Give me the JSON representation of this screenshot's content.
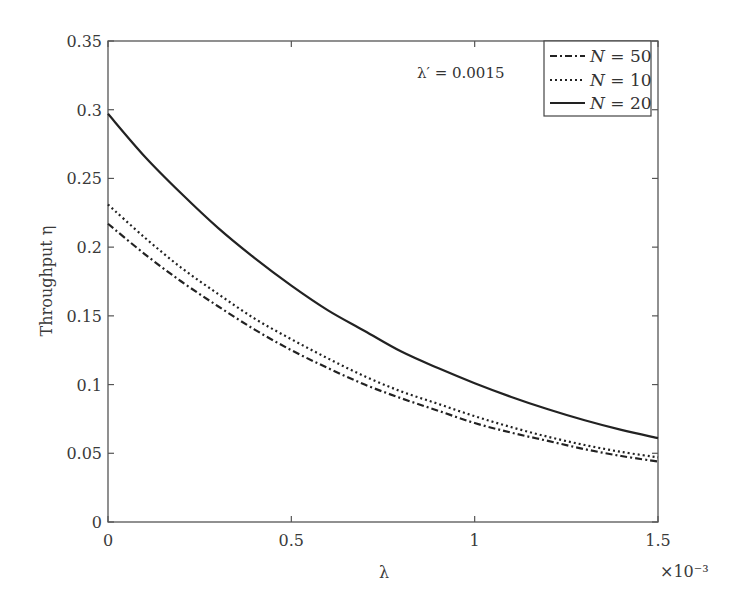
{
  "chart_data": {
    "type": "line",
    "title": "",
    "xlabel": "λ",
    "ylabel": "Throughput η",
    "x_multiplier_label": "×10⁻³",
    "xlim": [
      0,
      1.5
    ],
    "ylim": [
      0,
      0.35
    ],
    "x_ticks": [
      "0",
      "0.5",
      "1",
      "1.5"
    ],
    "x_tick_values": [
      0,
      0.5,
      1,
      1.5
    ],
    "y_ticks": [
      "0",
      "0.05",
      "0.1",
      "0.15",
      "0.2",
      "0.25",
      "0.3",
      "0.35"
    ],
    "y_tick_values": [
      0,
      0.05,
      0.1,
      0.15,
      0.2,
      0.25,
      0.3,
      0.35
    ],
    "grid": false,
    "annotation": "λ′ = 0.0015",
    "legend_position": "upper right",
    "x": [
      0,
      0.1,
      0.2,
      0.3,
      0.4,
      0.5,
      0.6,
      0.7,
      0.8,
      0.9,
      1.0,
      1.1,
      1.2,
      1.3,
      1.4,
      1.5
    ],
    "series": [
      {
        "name": "N = 50",
        "style": "dashdot",
        "values": [
          0.217,
          0.195,
          0.175,
          0.157,
          0.14,
          0.125,
          0.112,
          0.1,
          0.09,
          0.081,
          0.072,
          0.065,
          0.059,
          0.053,
          0.048,
          0.044
        ]
      },
      {
        "name": "N = 10",
        "style": "dotted",
        "values": [
          0.231,
          0.207,
          0.185,
          0.166,
          0.148,
          0.133,
          0.119,
          0.106,
          0.095,
          0.086,
          0.077,
          0.069,
          0.062,
          0.056,
          0.051,
          0.047
        ]
      },
      {
        "name": "N = 20",
        "style": "solid",
        "values": [
          0.297,
          0.266,
          0.239,
          0.214,
          0.192,
          0.172,
          0.154,
          0.139,
          0.124,
          0.112,
          0.101,
          0.091,
          0.082,
          0.074,
          0.067,
          0.061
        ]
      }
    ]
  },
  "legend": {
    "items": [
      {
        "label_var": "N",
        "label_rest": " = 50"
      },
      {
        "label_var": "N",
        "label_rest": " = 10"
      },
      {
        "label_var": "N",
        "label_rest": " = 20"
      }
    ]
  },
  "colors": {
    "line": "#222222",
    "axis": "#555555"
  }
}
